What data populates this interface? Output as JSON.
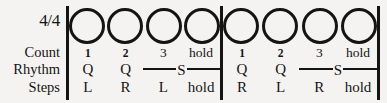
{
  "notation": {
    "time_signature": "4/4",
    "row_labels": {
      "count": "Count",
      "rhythm": "Rhythm",
      "steps": "Steps"
    },
    "slow_letter": "S",
    "measures": [
      {
        "beats": [
          {
            "circle": "open-circle",
            "count": "1",
            "rhythm": "Q",
            "step": "L"
          },
          {
            "circle": "open-circle",
            "count": "2",
            "rhythm": "Q",
            "step": "R"
          },
          {
            "circle": "open-circle",
            "count": "3",
            "rhythm": "",
            "step": "L"
          },
          {
            "circle": "open-circle",
            "count": "hold",
            "rhythm": "",
            "step": "hold"
          }
        ]
      },
      {
        "beats": [
          {
            "circle": "open-circle",
            "count": "1",
            "rhythm": "Q",
            "step": "R"
          },
          {
            "circle": "open-circle",
            "count": "2",
            "rhythm": "Q",
            "step": "L"
          },
          {
            "circle": "open-circle",
            "count": "3",
            "rhythm": "",
            "step": "R"
          },
          {
            "circle": "open-circle",
            "count": "hold",
            "rhythm": "",
            "step": "hold"
          }
        ]
      }
    ],
    "colors": {
      "ink": "#141414",
      "paper": "#f4f3f1"
    }
  }
}
